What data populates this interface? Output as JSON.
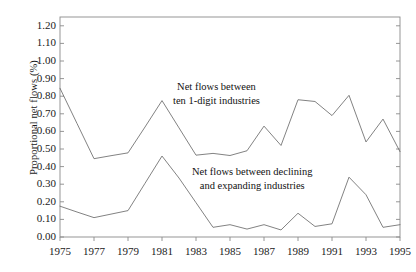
{
  "chart_data": {
    "type": "line",
    "title": "",
    "xlabel": "",
    "ylabel": "Proportional net flows (%)",
    "xlim": [
      1975,
      1995
    ],
    "ylim": [
      0.0,
      1.25
    ],
    "grid": false,
    "legend_position": "inline-annotation",
    "ytick_labels": [
      "0.00",
      "0.10",
      "0.20",
      "0.30",
      "0.40",
      "0.50",
      "0.60",
      "0.70",
      "0.80",
      "0.90",
      "1.00",
      "1.10",
      "1.20"
    ],
    "ytick_values": [
      0.0,
      0.1,
      0.2,
      0.3,
      0.4,
      0.5,
      0.6,
      0.7,
      0.8,
      0.9,
      1.0,
      1.1,
      1.2
    ],
    "xtick_labels": [
      "1975",
      "1977",
      "1979",
      "1981",
      "1983",
      "1985",
      "1987",
      "1989",
      "1991",
      "1993",
      "1995"
    ],
    "xtick_values": [
      1975,
      1977,
      1979,
      1981,
      1983,
      1985,
      1987,
      1989,
      1991,
      1993,
      1995
    ],
    "x": [
      1975,
      1976,
      1977,
      1978,
      1979,
      1980,
      1981,
      1982,
      1983,
      1984,
      1985,
      1986,
      1987,
      1988,
      1989,
      1990,
      1991,
      1992,
      1993,
      1994,
      1995
    ],
    "series": [
      {
        "name": "Net flows between ten 1-digit industries",
        "values": [
          0.845,
          0.645,
          0.445,
          0.462,
          0.478,
          0.625,
          0.775,
          0.62,
          0.465,
          0.475,
          0.463,
          0.49,
          0.63,
          0.52,
          0.78,
          0.77,
          0.69,
          0.805,
          0.54,
          0.67,
          0.485
        ],
        "color": "#6b6b6b"
      },
      {
        "name": "Net flows between  declining and expanding industries",
        "values": [
          0.175,
          0.142,
          0.11,
          0.13,
          0.15,
          0.305,
          0.46,
          0.335,
          0.195,
          0.055,
          0.07,
          0.045,
          0.07,
          0.04,
          0.135,
          0.06,
          0.075,
          0.34,
          0.24,
          0.055,
          0.07
        ],
        "color": "#6b6b6b"
      }
    ],
    "annotations": [
      {
        "name": "upper-series-label",
        "lines": [
          "Net flows between",
          "ten 1-digit industries"
        ]
      },
      {
        "name": "lower-series-label",
        "lines": [
          "Net flows between  declining",
          "and expanding industries"
        ]
      }
    ],
    "axis_color": "#8a8a8a"
  }
}
